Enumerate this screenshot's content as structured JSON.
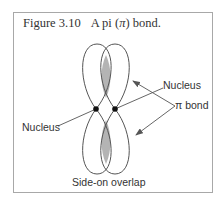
{
  "figure": {
    "number": "Figure 3.10",
    "title_pre": "A pi (",
    "title_symbol": "π",
    "title_post": ") bond."
  },
  "labels": {
    "nucleus_right": "Nucleus",
    "pi_bond": "π bond",
    "nucleus_left": "Nucleus",
    "overlap": "Side-on overlap"
  },
  "colors": {
    "line": "#555555",
    "overlap_fill": "#b4b4b4",
    "nucleus": "#111111",
    "frame": "#a8a8a8"
  }
}
